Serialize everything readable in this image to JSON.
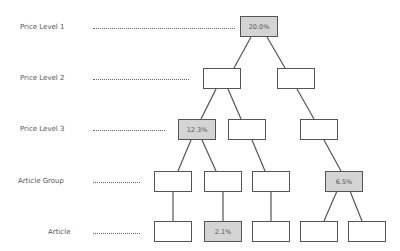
{
  "levels": [
    {
      "label": "Price Level 1"
    },
    {
      "label": "Price Level 2"
    },
    {
      "label": "Price Level 3"
    },
    {
      "label": "Article Group"
    },
    {
      "label": "Article"
    }
  ],
  "nodes": {
    "root": {
      "value": "20.0%",
      "highlighted": true
    },
    "l2_left": {
      "value": "",
      "highlighted": false
    },
    "l2_right": {
      "value": "",
      "highlighted": false
    },
    "l3_a": {
      "value": "12.3%",
      "highlighted": true
    },
    "l3_b": {
      "value": "",
      "highlighted": false
    },
    "l3_c": {
      "value": "",
      "highlighted": false
    },
    "ag_a": {
      "value": "",
      "highlighted": false
    },
    "ag_b": {
      "value": "",
      "highlighted": false
    },
    "ag_c": {
      "value": "",
      "highlighted": false
    },
    "ag_d": {
      "value": "6.5%",
      "highlighted": true
    },
    "art_a": {
      "value": "",
      "highlighted": false
    },
    "art_b": {
      "value": "2.1%",
      "highlighted": true
    },
    "art_c": {
      "value": "",
      "highlighted": false
    },
    "art_d": {
      "value": "",
      "highlighted": false
    },
    "art_e": {
      "value": "",
      "highlighted": false
    }
  },
  "colors": {
    "highlight_fill": "#d4d4d4",
    "border": "#555555"
  }
}
